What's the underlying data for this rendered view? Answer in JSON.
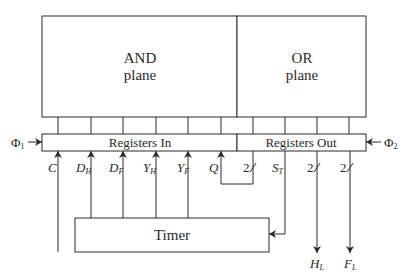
{
  "planes": {
    "and": {
      "line1": "AND",
      "line2": "plane"
    },
    "or": {
      "line1": "OR",
      "line2": "plane"
    }
  },
  "registers": {
    "in_label": "Registers In",
    "out_label": "Registers Out"
  },
  "clocks": {
    "phi1": {
      "symbol": "Φ",
      "sub": "1"
    },
    "phi2": {
      "symbol": "Φ",
      "sub": "2"
    }
  },
  "inputs": [
    {
      "name": "C",
      "sub": ""
    },
    {
      "name": "D",
      "sub": "H"
    },
    {
      "name": "D",
      "sub": "F"
    },
    {
      "name": "Y",
      "sub": "H"
    },
    {
      "name": "Y",
      "sub": "F"
    },
    {
      "name": "Q",
      "sub": ""
    }
  ],
  "outputs": [
    {
      "bus_width": "2"
    },
    {
      "name": "S",
      "sub": "T"
    },
    {
      "bus_width": "2",
      "name": "H",
      "sub": "L"
    },
    {
      "bus_width": "2",
      "name": "F",
      "sub": "L"
    }
  ],
  "timer": {
    "label": "Timer"
  }
}
